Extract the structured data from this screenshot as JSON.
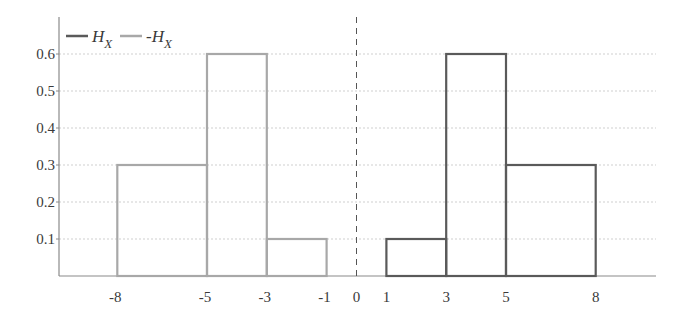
{
  "chart_data": {
    "type": "bar",
    "title": "",
    "xlabel": "",
    "ylabel": "",
    "xlim": [
      -10,
      10
    ],
    "ylim": [
      0,
      0.68
    ],
    "grid": "horizontal-dotted",
    "legend_position": "top-left",
    "x_ticks": [
      -8,
      -5,
      -3,
      -1,
      0,
      1,
      3,
      5,
      8
    ],
    "x_tick_labels": [
      "-8",
      "-5",
      "-3",
      "-1",
      "0",
      "1",
      "3",
      "5",
      "8"
    ],
    "y_ticks": [
      0.1,
      0.2,
      0.3,
      0.4,
      0.5,
      0.6
    ],
    "y_tick_labels": [
      "0.1",
      "0.2",
      "0.3",
      "0.4",
      "0.5",
      "0.6"
    ],
    "reference_line": {
      "x": 0,
      "style": "dashed"
    },
    "series": [
      {
        "name": "H_X",
        "label_main": "H",
        "label_sub": "X",
        "color": "#5a5a5a",
        "bins": [
          {
            "from": 1,
            "to": 3,
            "value": 0.1
          },
          {
            "from": 3,
            "to": 5,
            "value": 0.6
          },
          {
            "from": 5,
            "to": 8,
            "value": 0.3
          }
        ]
      },
      {
        "name": "-H_X",
        "label_main": "-H",
        "label_sub": "X",
        "color": "#a8a8a8",
        "bins": [
          {
            "from": -8,
            "to": -5,
            "value": 0.3
          },
          {
            "from": -5,
            "to": -3,
            "value": 0.6
          },
          {
            "from": -3,
            "to": -1,
            "value": 0.1
          }
        ]
      }
    ]
  }
}
